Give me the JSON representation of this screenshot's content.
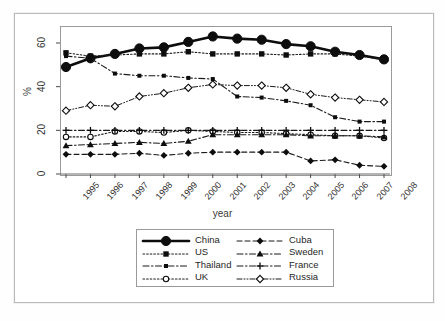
{
  "top_caption": "",
  "chart_data": {
    "type": "line",
    "title": "",
    "xlabel": "year",
    "ylabel": "%",
    "x": [
      1995,
      1996,
      1997,
      1998,
      1999,
      2000,
      2001,
      2002,
      2003,
      2004,
      2005,
      2006,
      2007,
      2008
    ],
    "xtick_labels": [
      "1995",
      "1996",
      "1997",
      "1998",
      "1999",
      "2000",
      "2001",
      "2002",
      "2003",
      "2004",
      "2005",
      "2006",
      "2007",
      "2008"
    ],
    "ytick_labels": [
      "0",
      "20",
      "40",
      "60"
    ],
    "ytick_values": [
      0,
      20,
      40,
      60
    ],
    "ylim": [
      0,
      68
    ],
    "xlim": [
      1994.5,
      2008.5
    ],
    "grid": false,
    "legend_position": "below-plot",
    "series": [
      {
        "name": "China",
        "marker": "filled-circle-large",
        "line": "solid-thick",
        "values": [
          49,
          53,
          55,
          57.5,
          58,
          60.5,
          63,
          62,
          61.5,
          59.5,
          58.5,
          56,
          54.5,
          52.5
        ]
      },
      {
        "name": "US",
        "marker": "filled-square",
        "line": "dotted",
        "values": [
          55.5,
          54,
          54.5,
          55,
          55,
          56,
          55,
          55,
          55,
          54.5,
          55,
          55,
          54,
          52.5
        ]
      },
      {
        "name": "Thailand",
        "marker": "filled-square-small",
        "line": "dash-dot",
        "values": [
          54,
          53,
          46,
          45,
          45,
          44,
          43.5,
          35.5,
          35,
          33.5,
          31.5,
          26,
          24,
          24
        ]
      },
      {
        "name": "UK",
        "marker": "open-circle",
        "line": "dotted",
        "values": [
          17,
          17,
          19.5,
          19.5,
          19,
          20,
          19.5,
          19,
          19,
          18.5,
          18,
          17.5,
          17.5,
          16.5
        ]
      },
      {
        "name": "Cuba",
        "marker": "filled-diamond",
        "line": "dashed",
        "values": [
          9,
          9,
          9,
          9.5,
          8.5,
          9.5,
          10,
          10,
          10,
          10,
          6,
          6.5,
          4,
          3.5
        ]
      },
      {
        "name": "Sweden",
        "marker": "filled-triangle",
        "line": "dash-dot",
        "values": [
          13,
          13.5,
          14,
          14.5,
          14,
          15,
          18,
          18,
          18,
          18,
          17.5,
          17.5,
          17.5,
          17
        ]
      },
      {
        "name": "France",
        "marker": "plus",
        "line": "dash-dot",
        "values": [
          20,
          20,
          20,
          20,
          20,
          20,
          20,
          20,
          20,
          20,
          20,
          20,
          20,
          20
        ]
      },
      {
        "name": "Russia",
        "marker": "open-diamond",
        "line": "dash-dot-dot",
        "values": [
          29,
          31.5,
          31,
          35.5,
          37,
          39.5,
          41,
          40.5,
          40.5,
          39.5,
          36.5,
          35,
          34,
          33
        ]
      }
    ]
  },
  "legend": {
    "items": [
      {
        "label": "China"
      },
      {
        "label": "Cuba"
      },
      {
        "label": "US"
      },
      {
        "label": "Sweden"
      },
      {
        "label": "Thailand"
      },
      {
        "label": "France"
      },
      {
        "label": "UK"
      },
      {
        "label": "Russia"
      }
    ]
  }
}
